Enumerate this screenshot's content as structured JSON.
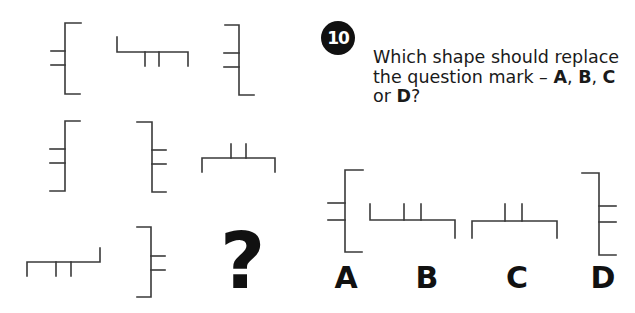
{
  "question": {
    "number": "10",
    "text_prefix": "Which shape should replace the question mark – ",
    "opt_a": "A",
    "sep1": ", ",
    "opt_b": "B",
    "sep2": ", ",
    "opt_c": "C",
    "sep3": " or ",
    "opt_d": "D",
    "suffix": "?"
  },
  "grid": {
    "missing_symbol": "?"
  },
  "options": [
    {
      "label": "A"
    },
    {
      "label": "B"
    },
    {
      "label": "C"
    },
    {
      "label": "D"
    }
  ],
  "colors": {
    "line": "#3a3a3a",
    "badge": "#111111",
    "text": "#1a1a1a"
  }
}
